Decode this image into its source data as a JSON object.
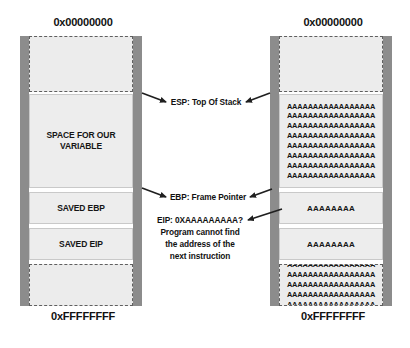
{
  "diagram": {
    "arrow_color": "#1f1f1f",
    "rail_color": "#8c8c8c",
    "cell_color": "#ededed"
  },
  "left_stack": {
    "top_address": "0x00000000",
    "bottom_address": "0xFFFFFFFF",
    "cells": [
      {
        "name": "empty-top",
        "style": "dashed",
        "text": ""
      },
      {
        "name": "variable-space",
        "style": "solid",
        "text": "SPACE FOR OUR\nVARIABLE"
      },
      {
        "name": "saved-ebp",
        "style": "solid",
        "text": "SAVED EBP"
      },
      {
        "name": "saved-eip",
        "style": "solid",
        "text": "SAVED EIP"
      },
      {
        "name": "empty-bottom",
        "style": "dashed",
        "text": ""
      }
    ]
  },
  "right_stack": {
    "top_address": "0x00000000",
    "bottom_address": "0xFFFFFFFF",
    "cells": [
      {
        "name": "empty-top",
        "style": "dashed",
        "text": ""
      },
      {
        "name": "overflowed-variable-space",
        "style": "solid",
        "text": "AAAAAAAAAAAAAAAAA\nAAAAAAAAAAAAAAAAA\nAAAAAAAAAAAAAAAAA\nAAAAAAAAAAAAAAAAA\nAAAAAAAAAAAAAAAAA\nAAAAAAAAAAAAAAAAA\nAAAAAAAAAAAAAAAAA\nAAAAAAAAAAAAAAAAA"
      },
      {
        "name": "overwritten-ebp",
        "style": "solid",
        "text": "AAAAAAAA"
      },
      {
        "name": "overwritten-eip",
        "style": "solid",
        "text": "AAAAAAAA"
      },
      {
        "name": "overflow-spill",
        "style": "dashed",
        "text": "AAAAAAAAAAAAAAAAA\nAAAAAAAAAAAAAAAAA\nAAAAAAAAAAAAAAAAA\nAAAAAAAAAAAAAAAAA\nAAAAAAAAAAAAAAAAA"
      }
    ]
  },
  "annotations": {
    "esp": "ESP: Top Of Stack",
    "ebp": "EBP: Frame Pointer",
    "eip": "EIP: 0XAAAAAAAAA?\nProgram cannot find\nthe address of the\nnext instruction"
  }
}
